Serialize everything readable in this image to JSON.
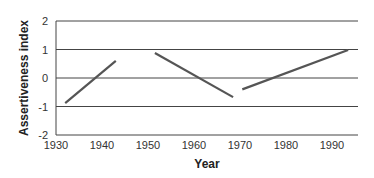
{
  "chart_data": {
    "type": "line",
    "title": "",
    "xlabel": "Year",
    "ylabel": "Assertiveness index",
    "xlim": [
      1930,
      1996
    ],
    "ylim": [
      -2,
      2
    ],
    "x_ticks": [
      "1930",
      "1940",
      "1950",
      "1960",
      "1970",
      "1980",
      "1990"
    ],
    "y_ticks": [
      "2",
      "1",
      "0",
      "-1",
      "-2"
    ],
    "grid": true,
    "legend": null,
    "series": [
      {
        "name": "segment-1",
        "x": [
          1932,
          1943
        ],
        "values": [
          -0.88,
          0.6
        ]
      },
      {
        "name": "segment-2",
        "x": [
          1951.5,
          1968.5
        ],
        "values": [
          0.88,
          -0.67
        ]
      },
      {
        "name": "segment-3",
        "x": [
          1970.5,
          1993.5
        ],
        "values": [
          -0.4,
          0.98
        ]
      }
    ],
    "colors": {
      "line": "#555555",
      "grid": "#444444"
    }
  }
}
